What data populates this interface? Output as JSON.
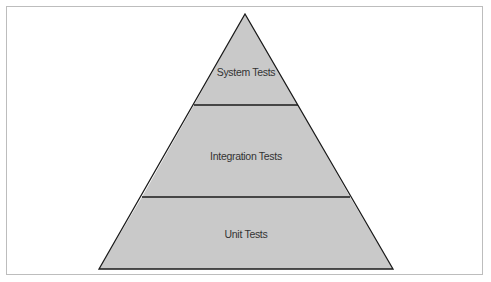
{
  "diagram": {
    "type": "test-pyramid",
    "colors": {
      "fill": "#c9c9c9",
      "stroke": "#1a1a1a",
      "text": "#333333",
      "frame": "#bdbdbd",
      "background": "#ffffff"
    },
    "tiers": [
      {
        "label": "System Tests",
        "position": "top"
      },
      {
        "label": "Integration Tests",
        "position": "middle"
      },
      {
        "label": "Unit Tests",
        "position": "bottom"
      }
    ]
  }
}
